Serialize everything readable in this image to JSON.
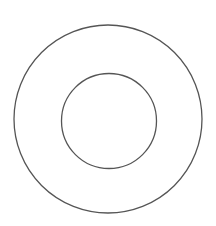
{
  "diagram": {
    "type": "concentric-circles",
    "background": "#ffffff",
    "stroke_color": "#555555",
    "stroke_width": 1.3,
    "circles": [
      {
        "name": "outer-circle",
        "cx": 108,
        "cy": 119,
        "r": 94
      },
      {
        "name": "inner-circle",
        "cx": 109,
        "cy": 121,
        "r": 47.5
      }
    ]
  }
}
